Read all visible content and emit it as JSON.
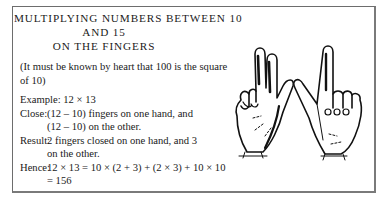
{
  "title": {
    "line1": "MULTIPLYING NUMBERS BETWEEN 10",
    "line2": "AND 15",
    "line3": "ON THE FINGERS"
  },
  "note": {
    "line1": "(It must be known by heart that 100 is the square",
    "line2": "of 10)"
  },
  "example": {
    "label": "Example:",
    "value": "12 × 13"
  },
  "close": {
    "label": "Close:",
    "line1": "(12 – 10) fingers on one hand, and",
    "line2": "(12 – 10) on the other."
  },
  "result": {
    "label": "Result:",
    "line1": "2 fingers closed on one hand, and 3",
    "line2": "on the other."
  },
  "hence": {
    "label": "Hence:",
    "line1": "12 × 13 = 10 × (2 + 3) + (2 × 3) + 10 × 10",
    "line2": "= 156"
  },
  "illustration": {
    "left_hand": "hand-two-fingers-up-icon",
    "right_hand": "hand-one-finger-up-icon"
  }
}
